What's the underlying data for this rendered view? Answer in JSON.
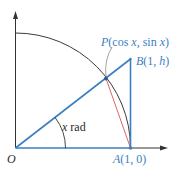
{
  "colors": {
    "accent_blue": "#3a7fc1",
    "axis_black": "#333333",
    "arc_dark": "#3a3a3a",
    "chord_red": "#d9534f",
    "leader_gray": "#8a8a8a"
  },
  "labels": {
    "origin": "O",
    "point_A": {
      "name": "A",
      "coords": "(1, 0)"
    },
    "point_B": {
      "name": "B",
      "coords_open": "(1, ",
      "h": "h",
      "coords_close": ")"
    },
    "point_P": {
      "name": "P",
      "text_open": "(cos ",
      "x1": "x",
      "mid": ", sin ",
      "x2": "x",
      "text_close": ")"
    },
    "angle": {
      "var": "x",
      "unit": " rad"
    }
  },
  "geometry": {
    "O": [
      15.5,
      148
    ],
    "A": [
      130.5,
      148
    ],
    "B": [
      130.5,
      59
    ],
    "P": [
      106,
      78.5
    ],
    "radius": 115,
    "y_axis_top": 12,
    "x_axis_end": 167,
    "angle_arc_radius": 50
  }
}
